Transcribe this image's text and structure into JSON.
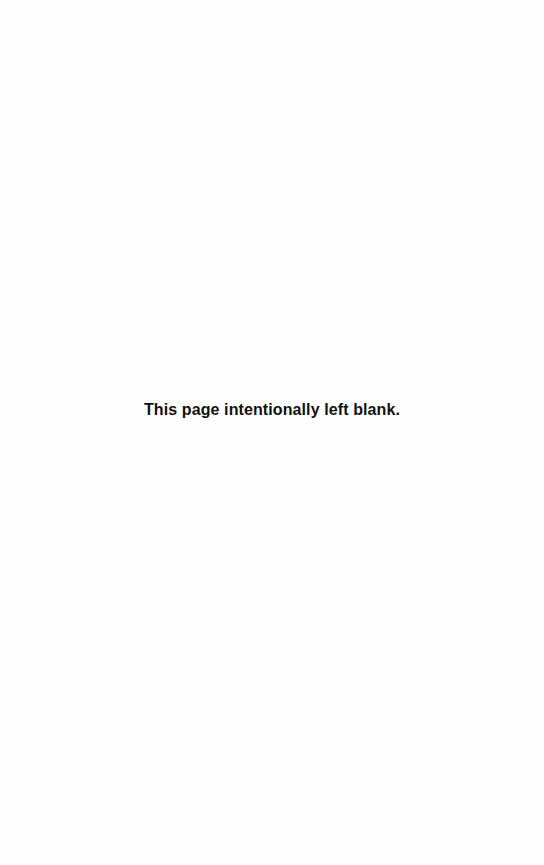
{
  "page": {
    "notice_text": "This page intentionally left blank."
  }
}
